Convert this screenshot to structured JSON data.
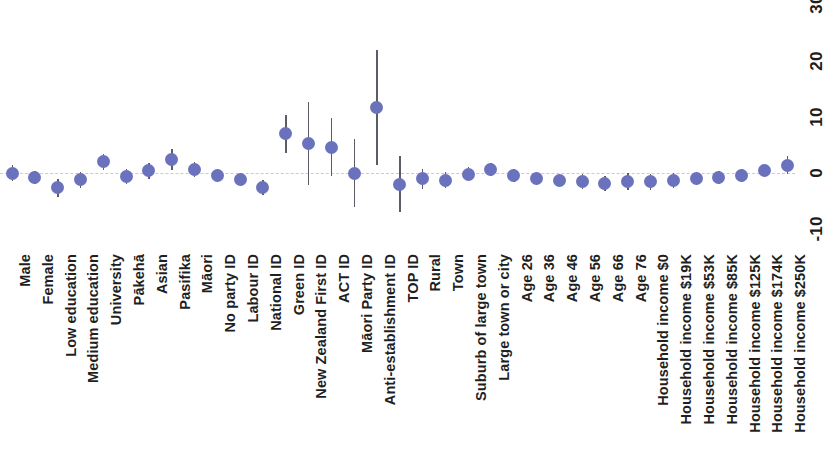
{
  "chart_data": {
    "type": "scatter",
    "title": "",
    "subtitle": "",
    "xlabel": "",
    "ylabel": "",
    "ylim": [
      -13,
      32
    ],
    "yticks": [
      -10,
      0,
      10,
      20,
      30
    ],
    "ytick_labels": [
      "-10",
      "0",
      "10",
      "20",
      "30"
    ],
    "grid": false,
    "legend": "none",
    "zero_line": 0,
    "y_axis_position": "right",
    "x_tick_rotation": 90,
    "marker_color": "#6b72bd",
    "errorbar_color": "#5c5c66",
    "zero_line_color": "#c9c9dd",
    "categories": [
      "Male",
      "Female",
      "Low education",
      "Medium education",
      "University",
      "Pākehā",
      "Asian",
      "Pasifika",
      "Māori",
      "No party ID",
      "Labour ID",
      "National ID",
      "Green ID",
      "New Zealand First ID",
      "ACT ID",
      "Māori Party ID",
      "Anti-establishment ID",
      "TOP ID",
      "Rural",
      "Town",
      "Suburb of large town",
      "Large town or city",
      "Age 26",
      "Age 36",
      "Age 46",
      "Age 56",
      "Age 66",
      "Age 76",
      "Household income $0",
      "Household income $19K",
      "Household income $53K",
      "Household income $85K",
      "Household income $125K",
      "Household income $174K",
      "Household income $250K"
    ],
    "values": [
      0.0,
      -0.8,
      -2.6,
      -1.2,
      2.0,
      -0.6,
      0.4,
      2.4,
      0.6,
      -0.4,
      -1.2,
      -2.6,
      7.0,
      5.2,
      4.6,
      0.0,
      11.6,
      -2.0,
      -1.0,
      -1.4,
      -0.2,
      0.6,
      -0.4,
      -1.0,
      -1.3,
      -1.5,
      -1.9,
      -1.5,
      -1.6,
      -1.3,
      -1.0,
      -0.8,
      -0.4,
      0.4,
      1.4
    ],
    "ci_low": [
      -1.4,
      -2.0,
      -4.2,
      -2.6,
      0.6,
      -2.0,
      -1.0,
      0.6,
      -0.8,
      -1.6,
      -2.4,
      -4.0,
      3.6,
      -2.2,
      -0.6,
      -6.0,
      1.4,
      -7.0,
      -2.8,
      -2.6,
      -1.4,
      -0.6,
      -1.6,
      -2.2,
      -2.4,
      -2.8,
      -3.2,
      -3.0,
      -3.0,
      -2.6,
      -2.2,
      -2.0,
      -1.6,
      -0.8,
      -0.2
    ],
    "ci_high": [
      1.4,
      0.4,
      -1.0,
      0.2,
      3.4,
      0.8,
      1.8,
      4.2,
      2.0,
      0.8,
      0.0,
      -1.2,
      10.4,
      12.6,
      9.8,
      6.0,
      21.8,
      3.0,
      0.8,
      0.2,
      1.0,
      1.8,
      0.8,
      0.2,
      -0.2,
      -0.2,
      -0.6,
      0.0,
      -0.2,
      0.0,
      0.2,
      0.4,
      0.8,
      1.6,
      3.0
    ]
  }
}
